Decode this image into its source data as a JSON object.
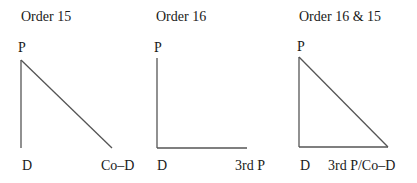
{
  "diagrams": [
    {
      "title": "Order 15",
      "labels": {
        "top": "P",
        "bottom_left": "D",
        "bottom_right": "Co–D"
      },
      "lines": [
        {
          "x1": 21,
          "y1": 60,
          "x2": 21,
          "y2": 148
        },
        {
          "x1": 21,
          "y1": 60,
          "x2": 112,
          "y2": 148
        }
      ]
    },
    {
      "title": "Order 16",
      "labels": {
        "top": "P",
        "bottom_left": "D",
        "bottom_right": "3rd P"
      },
      "lines": [
        {
          "x1": 157,
          "y1": 58,
          "x2": 157,
          "y2": 148
        },
        {
          "x1": 157,
          "y1": 148,
          "x2": 247,
          "y2": 148
        }
      ]
    },
    {
      "title": "Order 16 & 15",
      "labels": {
        "top": "P",
        "bottom_left": "D",
        "bottom_right": "3rd P/Co–D"
      },
      "lines": [
        {
          "x1": 299,
          "y1": 57,
          "x2": 299,
          "y2": 147
        },
        {
          "x1": 299,
          "y1": 147,
          "x2": 388,
          "y2": 147
        },
        {
          "x1": 299,
          "y1": 57,
          "x2": 388,
          "y2": 147
        }
      ]
    }
  ],
  "colors": {
    "line": "#555555",
    "text": "#1a1a1a"
  }
}
